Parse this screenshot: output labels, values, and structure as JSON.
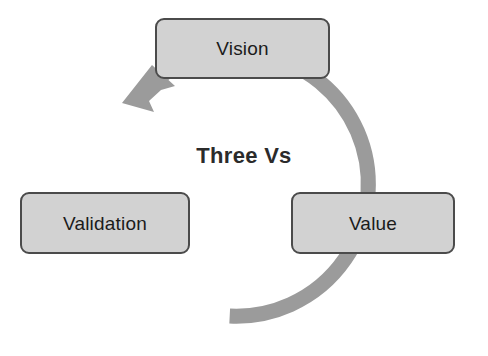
{
  "diagram": {
    "title": "Three Vs",
    "type": "cycle",
    "direction": "counter-clockwise",
    "background_color": "#ffffff",
    "center_label": "Three Vs",
    "center_label_color": "#2b2b2b",
    "ring": {
      "name": "cycle-arrow-ring",
      "color": "#9b9b9b",
      "center_x": 243,
      "center_y": 184,
      "radius": 132,
      "thickness": 15,
      "arrowhead": {
        "name": "cycle-arrowhead",
        "points_to": "Vision",
        "color": "#9b9b9b"
      }
    },
    "nodes": [
      {
        "id": "vision",
        "label": "Vision",
        "position": "top",
        "fill_color": "#d2d2d2",
        "border_color": "#4b4b4b",
        "text_color": "#1b1b1b"
      },
      {
        "id": "validation",
        "label": "Validation",
        "position": "left",
        "fill_color": "#d2d2d2",
        "border_color": "#4b4b4b",
        "text_color": "#1b1b1b"
      },
      {
        "id": "value",
        "label": "Value",
        "position": "right",
        "fill_color": "#d2d2d2",
        "border_color": "#4b4b4b",
        "text_color": "#1b1b1b"
      }
    ]
  }
}
